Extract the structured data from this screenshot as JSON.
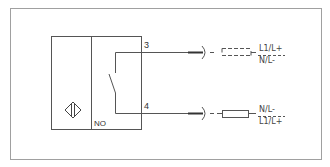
{
  "diagram": {
    "type": "wiring-diagram",
    "sensor": {
      "symbol": "inductive-sensor-symbol",
      "output_type": "NO"
    },
    "terminals": [
      {
        "number": "3",
        "load": "dashed-load",
        "top_label": "L1/L+",
        "bottom_label": "N/L-"
      },
      {
        "number": "4",
        "load": "load-resistor",
        "top_label": "N/L-",
        "bottom_label": "L1/L+"
      }
    ],
    "colors": {
      "line": "#555555",
      "frame": "#999999",
      "text": "#333333"
    }
  }
}
